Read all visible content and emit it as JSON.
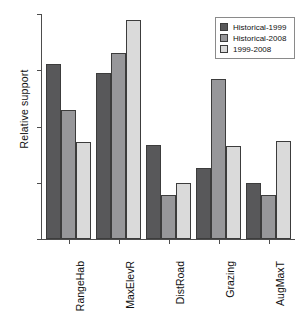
{
  "chart_data": {
    "type": "bar",
    "title": "",
    "xlabel": "",
    "ylabel": "Relative support",
    "categories": [
      "RangeHab",
      "MaxElevR",
      "DistRoad",
      "Grazing",
      "AugMaxT"
    ],
    "series": [
      {
        "name": "Historical-1999",
        "color": "#58585a",
        "values": [
          0.311,
          0.295,
          0.168,
          0.126,
          0.1
        ]
      },
      {
        "name": "Historical-2008",
        "color": "#97979a",
        "values": [
          0.229,
          0.33,
          0.078,
          0.284,
          0.078
        ]
      },
      {
        "name": "1999-2008",
        "color": "#dadada",
        "values": [
          0.173,
          0.39,
          0.099,
          0.165,
          0.175
        ]
      }
    ],
    "ylim": [
      0.0,
      0.4
    ],
    "yticks": [
      0.0,
      0.1,
      0.2,
      0.3,
      0.4
    ],
    "ytick_labels": [
      "0.0",
      "0.1",
      "0.2",
      "0.3",
      "0.4"
    ],
    "grid": false,
    "legend_position": "upper right"
  },
  "legend": {
    "items": [
      {
        "label": "Historical-1999"
      },
      {
        "label": "Historical-2008"
      },
      {
        "label": "1999-2008"
      }
    ]
  },
  "axis": {
    "y_label": "Relative support"
  }
}
